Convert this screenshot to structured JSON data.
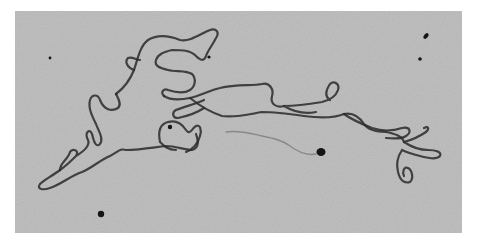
{
  "image": {
    "subject": "electron micrograph of a single DNA molecule strand on a speckled background",
    "palette": {
      "background": "#ffffff",
      "field": "#b4b4b4",
      "speckle": "#3a3a3a",
      "strand": "#2a2a2a",
      "particle": "#151515"
    },
    "features": [
      "long looping DNA strand",
      "dark particle near center",
      "dark particle lower left",
      "dark particle center right",
      "small particles upper right"
    ]
  }
}
